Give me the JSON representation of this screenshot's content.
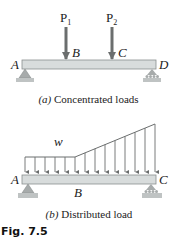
{
  "figure": {
    "label": "Fig. 7.5",
    "panel_a": {
      "caption_prefix": "(a)",
      "caption_text": "Concentrated loads",
      "points": {
        "left": "A",
        "load1": "B",
        "load2": "C",
        "right": "D"
      },
      "loads": [
        {
          "name": "P",
          "subscript": "1",
          "at": "B"
        },
        {
          "name": "P",
          "subscript": "2",
          "at": "C"
        }
      ],
      "supports": {
        "left": "pin",
        "right": "roller"
      }
    },
    "panel_b": {
      "caption_prefix": "(b)",
      "caption_text": "Distributed load",
      "points": {
        "left": "A",
        "middle": "B",
        "right": "C"
      },
      "load_label": "w",
      "load_profile": "uniform then linearly increasing",
      "supports": {
        "left": "pin",
        "right": "roller"
      }
    }
  },
  "colors": {
    "beam_fill": "#d8dcdc",
    "beam_stroke": "#8a8f8f",
    "arrow": "#6b6e6e",
    "support": "#a7abab",
    "text": "#222222"
  }
}
